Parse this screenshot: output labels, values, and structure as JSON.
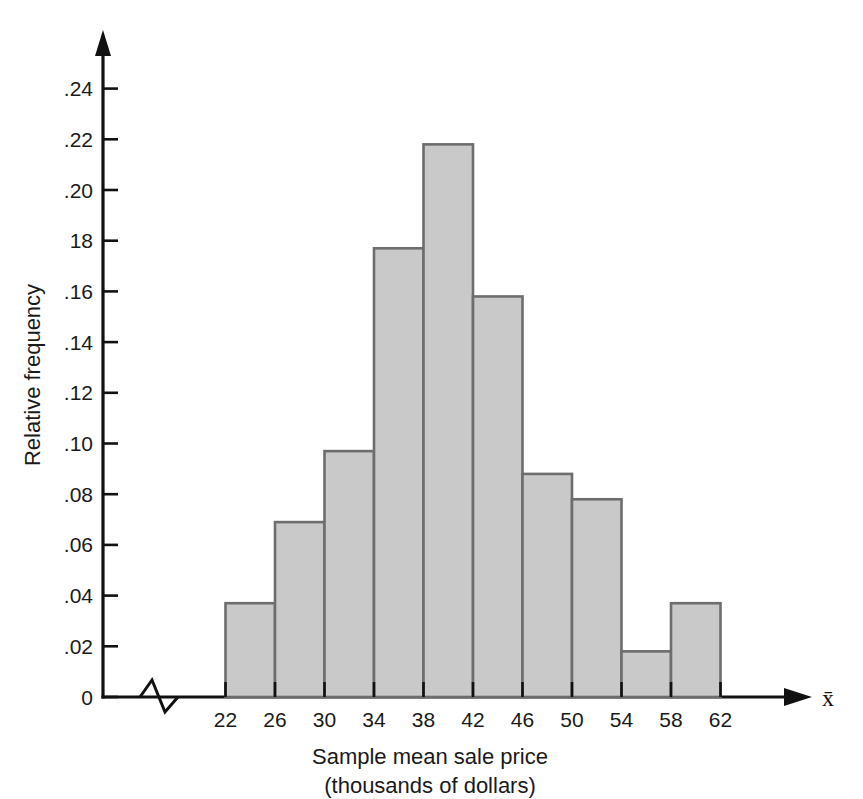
{
  "chart_data": {
    "type": "bar",
    "title": "",
    "subtitle": "",
    "xlabel": "Sample mean sale price",
    "xlabel_line2": "(thousands of dollars)",
    "ylabel": "Relative frequency",
    "x_axis_symbol": "x̄",
    "bin_edges": [
      22,
      26,
      30,
      34,
      38,
      42,
      46,
      50,
      54,
      58,
      62
    ],
    "categories": [
      "22-26",
      "26-30",
      "30-34",
      "34-38",
      "38-42",
      "42-46",
      "46-50",
      "50-54",
      "54-58",
      "58-62"
    ],
    "values": [
      0.037,
      0.069,
      0.097,
      0.177,
      0.218,
      0.158,
      0.088,
      0.078,
      0.018,
      0.037
    ],
    "xtick_labels": [
      "22",
      "26",
      "30",
      "34",
      "38",
      "42",
      "46",
      "50",
      "54",
      "58",
      "62"
    ],
    "ytick_labels": [
      "0",
      ".02",
      ".04",
      ".06",
      ".08",
      ".10",
      ".12",
      ".14",
      ".16",
      "18",
      ".20",
      ".22",
      ".24"
    ],
    "ytick_values": [
      0,
      0.02,
      0.04,
      0.06,
      0.08,
      0.1,
      0.12,
      0.14,
      0.16,
      0.18,
      0.2,
      0.22,
      0.24
    ],
    "ylim": [
      0,
      0.25
    ],
    "xlim": [
      22,
      62
    ],
    "grid": false,
    "legend": "none",
    "axis_break": true,
    "bar_fill_color": "#c9c9c9",
    "bar_border_color": "#6d6d6d",
    "axis_color": "#111111",
    "background_color": "#ffffff"
  }
}
